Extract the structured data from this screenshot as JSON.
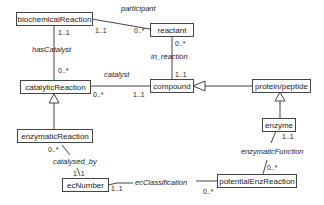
{
  "classes": {
    "biochemicalReaction": "biochemicalReaction",
    "reactant": "reactant",
    "catalyticReaction": "catalyticReaction",
    "compound": "compound",
    "protein_peptide": "protein/peptide",
    "enzymaticReaction": "enzymaticReaction",
    "enzyme": "enzyme",
    "ecNumber": "ecNumber",
    "potentialEnzReaction": "potentialEnzReaction"
  },
  "associations": {
    "participant": {
      "label": "participant",
      "source_mult": "1..1",
      "target_mult": "0..*"
    },
    "hasCatalyst": {
      "label": "hasCatalyst",
      "source_mult": "1..1",
      "target_mult": "0..*"
    },
    "in_reaction": {
      "label": "in_reaction",
      "source_mult": "0..*",
      "target_mult": "1..1"
    },
    "catalyst": {
      "label": "catalyst",
      "source_mult": "0..*",
      "target_mult": "1..1"
    },
    "catalysed_by": {
      "label": "catalysed_by",
      "source_mult": "0..*",
      "target_mult": "1..1"
    },
    "enzymaticFunction": {
      "label": "enzymaticFunction",
      "source_mult": "1..1",
      "target_mult": "0..*"
    },
    "ecClassification": {
      "label": "ecClassification",
      "source_mult": "1..1",
      "target_mult": "0..*"
    }
  },
  "generalizations": [
    {
      "child": "enzymaticReaction",
      "parent": "catalyticReaction"
    },
    {
      "child": "protein/peptide",
      "parent": "compound"
    },
    {
      "child": "enzyme",
      "parent": "protein/peptide"
    }
  ]
}
